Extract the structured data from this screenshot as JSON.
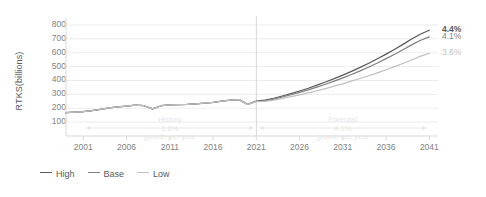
{
  "chart_data": {
    "type": "line",
    "title": "",
    "xlabel": "",
    "ylabel": "RTKS(billions)",
    "ylim": [
      0,
      850
    ],
    "yticks": [
      100,
      200,
      300,
      400,
      500,
      600,
      700,
      800
    ],
    "xlim": [
      1999,
      2042
    ],
    "xticks": [
      2001,
      2006,
      2011,
      2016,
      2021,
      2026,
      2031,
      2036,
      2041
    ],
    "grid": "horizontal",
    "legend_position": "bottom-left",
    "x": [
      1999,
      2000,
      2001,
      2002,
      2003,
      2004,
      2005,
      2006,
      2007,
      2008,
      2009,
      2010,
      2011,
      2012,
      2013,
      2014,
      2015,
      2016,
      2017,
      2018,
      2019,
      2020,
      2021,
      2022,
      2023,
      2024,
      2025,
      2026,
      2027,
      2028,
      2029,
      2030,
      2031,
      2032,
      2033,
      2034,
      2035,
      2036,
      2037,
      2038,
      2039,
      2040,
      2041
    ],
    "series": [
      {
        "name": "High",
        "color": "#595959",
        "values": [
          168,
          172,
          176,
          182,
          192,
          203,
          210,
          216,
          222,
          218,
          196,
          218,
          224,
          226,
          228,
          232,
          236,
          243,
          252,
          258,
          262,
          228,
          252,
          258,
          272,
          288,
          305,
          324,
          344,
          366,
          389,
          413,
          439,
          466,
          494,
          524,
          556,
          590,
          625,
          662,
          700,
          735,
          762
        ],
        "end_label": "4.4%"
      },
      {
        "name": "Base",
        "color": "#7f7f7f",
        "values": [
          168,
          172,
          176,
          182,
          192,
          203,
          210,
          216,
          222,
          218,
          196,
          218,
          224,
          226,
          228,
          232,
          236,
          243,
          252,
          258,
          262,
          228,
          250,
          254,
          266,
          281,
          297,
          314,
          332,
          352,
          373,
          395,
          419,
          443,
          469,
          497,
          526,
          557,
          589,
          623,
          658,
          690,
          714
        ],
        "end_label": "4.1%"
      },
      {
        "name": "Low",
        "color": "#bfbfbf",
        "values": [
          168,
          172,
          176,
          182,
          192,
          203,
          210,
          216,
          222,
          218,
          196,
          218,
          224,
          226,
          228,
          232,
          236,
          243,
          252,
          258,
          262,
          228,
          248,
          250,
          259,
          271,
          284,
          297,
          311,
          326,
          342,
          359,
          376,
          395,
          414,
          434,
          455,
          477,
          500,
          524,
          549,
          575,
          596
        ],
        "end_label": "3.6%"
      }
    ],
    "annotations": [
      {
        "name": "history",
        "lines": [
          "History",
          "3.6%",
          "growth per year"
        ],
        "x_from": 2001,
        "x_to": 2021,
        "color": "#e6e6e6"
      },
      {
        "name": "forecast",
        "lines": [
          "Forecast",
          "4.1%",
          "growth per year"
        ],
        "x_from": 2021,
        "x_to": 2041,
        "color": "#e6e6e6"
      }
    ],
    "divider_year": 2021
  },
  "legend": {
    "items": [
      {
        "label": "High",
        "color": "#595959"
      },
      {
        "label": "Base",
        "color": "#808080"
      },
      {
        "label": "Low",
        "color": "#bfbfbf"
      }
    ]
  }
}
